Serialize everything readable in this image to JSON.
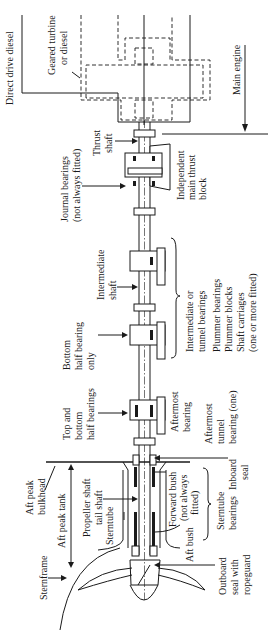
{
  "figure": {
    "orientation": "rotated-90-ccw",
    "colors": {
      "ink": "#1a1a1a",
      "paper": "#ffffff"
    }
  },
  "labels": {
    "direct_drive_diesel": "Direct drive diesel",
    "geared_turbine_1": "Geared turbine",
    "geared_turbine_2": "or diesel",
    "main_engine": "Main engine",
    "thrust_shaft_1": "Thrust",
    "thrust_shaft_2": "shaft",
    "journal_bearings_1": "Journal bearings",
    "journal_bearings_2": "(not always fitted)",
    "independent_thrust_1": "Independent",
    "independent_thrust_2": "main thrust",
    "independent_thrust_3": "block",
    "intermediate_shaft_1": "Intermediate",
    "intermediate_shaft_2": "shaft",
    "tunnel_bearings_1": "Intermediate or",
    "tunnel_bearings_2": "tunnel bearings",
    "plummer_1": "Plummer bearings",
    "plummer_2": "Plummer blocks",
    "plummer_3": "Shaft carriages",
    "plummer_4": "(one or more fitted)",
    "bottom_half_1": "Bottom",
    "bottom_half_2": "half bearing",
    "bottom_half_3": "only",
    "top_bottom_1": "Top and",
    "top_bottom_2": "bottom",
    "top_bottom_3": "half bearings",
    "aftermost_bearing_1": "Aftermost",
    "aftermost_bearing_2": "bearing",
    "aftermost_tunnel_1": "Aftermost",
    "aftermost_tunnel_2": "tunnel",
    "aftermost_tunnel_3": "bearing (one)",
    "aft_peak_bulkhead_1": "Aft peak",
    "aft_peak_bulkhead_2": "bulkhead",
    "aft_peak_tank": "Aft peak tank",
    "propeller_shaft_1": "Propeller shaft",
    "propeller_shaft_2": "tail shaft",
    "sterntube": "Sterntube",
    "sternframe": "Sternframe",
    "inboard_seal_1": "Inboard",
    "inboard_seal_2": "seal",
    "forward_bush_1": "Forward bush",
    "forward_bush_2": "(not always",
    "forward_bush_3": "fitted)",
    "aft_bush": "Aft bush",
    "sterntube_bearings_1": "Sterntube",
    "sterntube_bearings_2": "bearings",
    "outboard_seal_1": "Outboard",
    "outboard_seal_2": "seal with",
    "outboard_seal_3": "ropeguard"
  }
}
